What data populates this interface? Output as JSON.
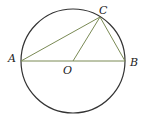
{
  "diagram": {
    "circle": {
      "cx": 73,
      "cy": 61,
      "r": 52,
      "color": "#333333"
    },
    "points": {
      "A": {
        "label": "A",
        "x": 21,
        "y": 61
      },
      "B": {
        "label": "B",
        "x": 125,
        "y": 61
      },
      "C": {
        "label": "C",
        "x": 100,
        "y": 17
      },
      "O": {
        "label": "O",
        "x": 73,
        "y": 61
      }
    },
    "segments": [
      "AB",
      "AC",
      "BC",
      "OC"
    ],
    "segment_color": "#7a8a55"
  }
}
